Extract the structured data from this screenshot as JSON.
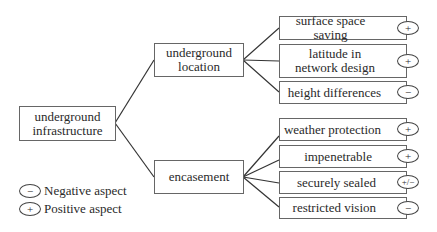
{
  "diagram": {
    "root": {
      "label_line1": "underground",
      "label_line2": "infrastructure"
    },
    "branches": [
      {
        "label_line1": "underground",
        "label_line2": "location",
        "leaves": [
          {
            "label": "surface space saving",
            "aspect": "+"
          },
          {
            "label_line1": "latitude in",
            "label_line2": "network design",
            "aspect": "+"
          },
          {
            "label": "height differences",
            "aspect": "−"
          }
        ]
      },
      {
        "label": "encasement",
        "leaves": [
          {
            "label": "weather protection",
            "aspect": "+"
          },
          {
            "label": "impenetrable",
            "aspect": "+"
          },
          {
            "label": "securely sealed",
            "aspect": "+/−"
          },
          {
            "label": "restricted vision",
            "aspect": "−"
          }
        ]
      }
    ]
  },
  "legend": [
    {
      "symbol": "−",
      "label": "Negative aspect"
    },
    {
      "symbol": "+",
      "label": "Positive aspect"
    }
  ]
}
